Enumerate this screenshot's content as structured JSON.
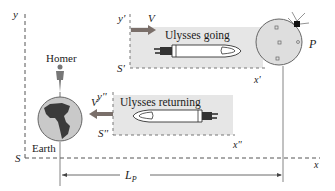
{
  "figure": {
    "frames": {
      "S": {
        "axis_y": "y",
        "axis_x": "x",
        "origin": "S"
      },
      "S_prime": {
        "axis_y": "y'",
        "axis_x": "x'",
        "origin": "S'",
        "velocity": "V",
        "title": "Ulysses going"
      },
      "S_double_prime": {
        "axis_y": "y''",
        "axis_x": "x''",
        "origin": "S''",
        "velocity": "V",
        "title": "Ulysses returning"
      }
    },
    "bodies": {
      "earth": "Earth",
      "homer": "Homer",
      "planet": "P"
    },
    "distance": {
      "label": "L",
      "subscript": "P"
    },
    "colors": {
      "frame_fill": "#e6e6e6",
      "velocity_arrow": "#7a6f6a",
      "earth_fill": "#c9c9c9",
      "continent": "#3a3a3a",
      "planet_fill": "#dedede",
      "axis": "#555555"
    }
  }
}
